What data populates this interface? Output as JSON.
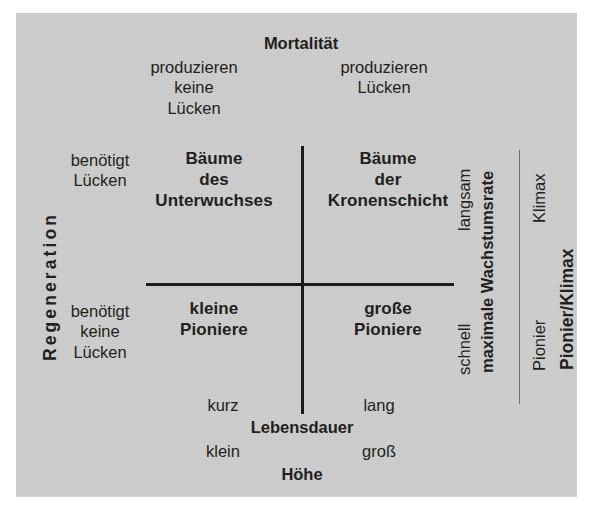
{
  "figure": {
    "type": "2x2-conceptual-matrix",
    "background_color": "#cdcdcd",
    "ink_color": "#231f20",
    "language": "de"
  },
  "axes": {
    "top": {
      "title": "Mortalität",
      "left_value": "produzieren\nkeine\nLücken",
      "right_value": "produzieren\nLücken"
    },
    "left": {
      "title": "Regeneration",
      "upper_value": "benötigt\nLücken",
      "lower_value": "benötigt\nkeine\nLücken"
    },
    "bottom_primary": {
      "title": "Lebensdauer",
      "left_value": "kurz",
      "right_value": "lang"
    },
    "bottom_secondary": {
      "title": "Höhe",
      "left_value": "klein",
      "right_value": "groß"
    },
    "right_inner": {
      "title": "maximale Wachstumsrate",
      "upper_value": "langsam",
      "lower_value": "schnell"
    },
    "right_outer": {
      "title": "Pionier/Klimax",
      "upper_value": "Klimax",
      "lower_value": "Pionier"
    }
  },
  "quadrants": {
    "top_left": "Bäume\ndes\nUnterwuchses",
    "top_right": "Bäume\nder\nKronenschicht",
    "bottom_left": "kleine\nPioniere",
    "bottom_right": "große\nPioniere"
  }
}
